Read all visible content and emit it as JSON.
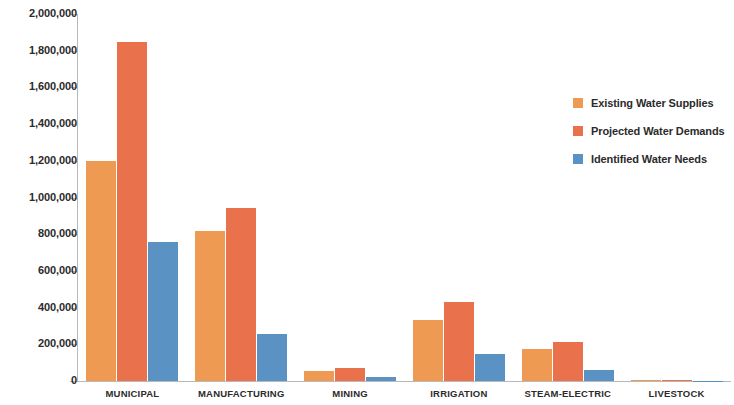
{
  "chart_data": {
    "type": "bar",
    "title": "",
    "subtitle": "",
    "xlabel": "",
    "ylabel": "",
    "grid": false,
    "legend_position": "right",
    "ylim": [
      0,
      2000000
    ],
    "ytick_values": [
      0,
      200000,
      400000,
      600000,
      800000,
      1000000,
      1200000,
      1400000,
      1600000,
      1800000,
      2000000
    ],
    "ytick_labels": [
      "0",
      "200,000",
      "400,000",
      "600,000",
      "800,000",
      "1,000,000",
      "1,200,000",
      "1,400,000",
      "1,600,000",
      "1,800,000",
      "2,000,000"
    ],
    "categories": [
      "MUNICIPAL",
      "MANUFACTURING",
      "MINING",
      "IRRIGATION",
      "STEAM-ELECTRIC",
      "LIVESTOCK"
    ],
    "series": [
      {
        "name": "Existing Water Supplies",
        "color": "#ee9a52",
        "values": [
          1200000,
          820000,
          55000,
          330000,
          175000,
          5000
        ]
      },
      {
        "name": "Projected Water Demands",
        "color": "#e9714c",
        "values": [
          1850000,
          945000,
          72000,
          430000,
          215000,
          6000
        ]
      },
      {
        "name": "Identified Water Needs",
        "color": "#5b92c4",
        "values": [
          760000,
          255000,
          20000,
          145000,
          60000,
          2000
        ]
      }
    ]
  },
  "axis": {
    "line_color": "#b9b9b9"
  }
}
